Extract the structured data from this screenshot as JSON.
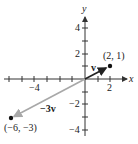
{
  "figure": {
    "type": "vector-diagram",
    "axes": {
      "x_label": "x",
      "y_label": "y",
      "x_tick_labels": [
        {
          "value": -4,
          "text": "−4"
        },
        {
          "value": 2,
          "text": "2"
        }
      ],
      "y_tick_labels": [
        {
          "value": 4,
          "text": "4"
        },
        {
          "value": 2,
          "text": "2"
        },
        {
          "value": -2,
          "text": "−2"
        },
        {
          "value": -4,
          "text": "−4"
        }
      ],
      "x_range": [
        -6,
        3
      ],
      "y_range": [
        -4,
        5
      ]
    },
    "vectors": [
      {
        "name": "v",
        "label": "v",
        "from": [
          0,
          0
        ],
        "to": [
          2,
          1
        ],
        "color": "#222222"
      },
      {
        "name": "neg3v",
        "label": "−3v",
        "from": [
          0,
          0
        ],
        "to": [
          -6,
          -3
        ],
        "color": "#a8a8a8"
      }
    ],
    "points": [
      {
        "coords": [
          2,
          1
        ],
        "label": "(2, 1)"
      },
      {
        "coords": [
          -6,
          -3
        ],
        "label": "(−6, −3)"
      }
    ]
  }
}
